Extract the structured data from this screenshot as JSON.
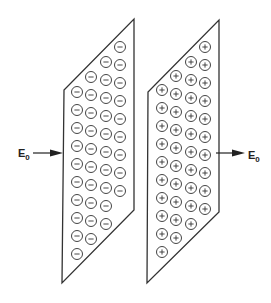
{
  "diagram": {
    "left_plate": {
      "charge_sign": "-",
      "charge_icon": "minus-in-circle",
      "columns": 4,
      "circles_per_column": [
        10,
        10,
        10,
        9
      ]
    },
    "right_plate": {
      "charge_sign": "+",
      "charge_icon": "plus-in-circle",
      "columns": 4,
      "circles_per_column": [
        10,
        10,
        10,
        10
      ]
    },
    "incoming_field": {
      "label": "E",
      "subscript": "0",
      "direction": "right"
    },
    "outgoing_field": {
      "label": "E",
      "subscript": "0",
      "direction": "right"
    },
    "colors": {
      "stroke": "#333333",
      "background": "#ffffff"
    }
  }
}
